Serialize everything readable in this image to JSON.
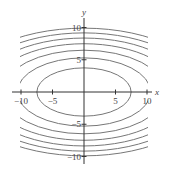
{
  "chart_data": {
    "type": "contour",
    "title": "",
    "xlabel": "x",
    "ylabel": "y",
    "function_form": "x^2/4 + y^2 = c",
    "levels": [
      14,
      28,
      42,
      56,
      70,
      84,
      98
    ],
    "xlim": [
      -10.5,
      10.5
    ],
    "ylim": [
      -10.5,
      10.5
    ],
    "x_ticks": [
      -10,
      -5,
      5,
      10
    ],
    "y_ticks": [
      -10,
      -5,
      5,
      10
    ],
    "x_tick_labels": [
      "-10",
      "-5",
      "5",
      "10"
    ],
    "y_tick_labels": [
      "-10",
      "-5",
      "5",
      "10"
    ],
    "grid": false,
    "legend": null,
    "line_color": "#777777",
    "axis_color": "#333333"
  },
  "labels": {
    "x_axis": "x",
    "y_axis": "y"
  }
}
